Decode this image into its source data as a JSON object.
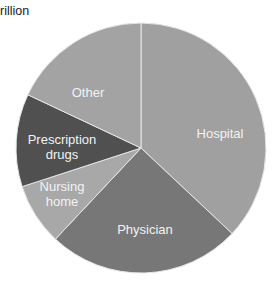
{
  "chart_data": {
    "type": "pie",
    "title": "rillion",
    "start_angle_deg": 0,
    "direction": "clockwise",
    "center": [
      141,
      148
    ],
    "radius": 125,
    "slices": [
      {
        "label": "Hospital",
        "label_lines": [
          "Hospital"
        ],
        "value": 37,
        "color": "#a0a0a0",
        "label_pos": [
          220,
          134
        ]
      },
      {
        "label": "Physician",
        "label_lines": [
          "Physician"
        ],
        "value": 25,
        "color": "#777777",
        "label_pos": [
          145,
          230
        ]
      },
      {
        "label": "Nursing home",
        "label_lines": [
          "Nursing",
          "home"
        ],
        "value": 8,
        "color": "#a8a8a8",
        "label_pos": [
          62,
          194
        ]
      },
      {
        "label": "Prescription drugs",
        "label_lines": [
          "Prescription",
          "drugs"
        ],
        "value": 12,
        "color": "#505050",
        "label_pos": [
          62,
          147
        ]
      },
      {
        "label": "Other",
        "label_lines": [
          "Other"
        ],
        "value": 18,
        "color": "#a3a3a3",
        "label_pos": [
          88,
          93
        ]
      }
    ],
    "slice_border_color": "#e6e6e6"
  }
}
